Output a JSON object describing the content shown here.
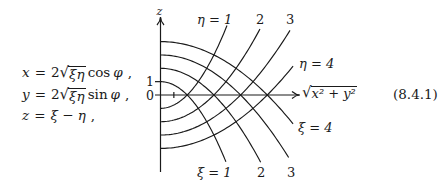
{
  "equations": {
    "number": "(8.4.1)",
    "lines": [
      {
        "lhs": "x",
        "eq": "=",
        "coef": "2",
        "radix": "√",
        "radicand": "ξη",
        "func": "cos",
        "arg": "φ",
        "trail": ","
      },
      {
        "lhs": "y",
        "eq": "=",
        "coef": "2",
        "radix": "√",
        "radicand": "ξη",
        "func": "sin",
        "arg": "φ",
        "trail": ","
      },
      {
        "lhs": "z",
        "eq": "=",
        "expr": "ξ − η",
        "trail": ","
      }
    ]
  },
  "diagram": {
    "origin_px": [
      160.5,
      95
    ],
    "unit_px": 13.35,
    "axes": {
      "vertical_label": "z",
      "horizontal_label_radix": "√",
      "horizontal_label_radicand": "x² + y²",
      "tick_one": "1",
      "tick_zero": "0"
    },
    "xi_curves": [
      {
        "value": 1,
        "rho_max": 4.9
      },
      {
        "value": 2,
        "rho_max": 7.5
      },
      {
        "value": 3,
        "rho_max": 9.6
      },
      {
        "value": 4,
        "rho_max": 9.93
      }
    ],
    "eta_curves": [
      {
        "value": 1,
        "rho_max": 4.98
      },
      {
        "value": 2,
        "rho_max": 7.45
      },
      {
        "value": 3,
        "rho_max": 9.7
      },
      {
        "value": 4,
        "rho_max": 9.93
      }
    ],
    "labels": {
      "eta_1": "η = 1",
      "eta_2": "2",
      "eta_3": "3",
      "eta_4": "η = 4",
      "xi_1": "ξ = 1",
      "xi_2": "2",
      "xi_3": "3",
      "xi_4": "ξ = 4"
    },
    "stroke_color": "#1a1a1a"
  }
}
